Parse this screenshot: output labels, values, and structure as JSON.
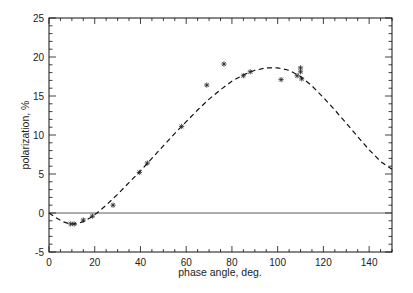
{
  "chart_data": {
    "type": "scatter",
    "title": "",
    "xlabel": "phase angle, deg.",
    "ylabel": "polarization, %",
    "xlim": [
      0,
      150
    ],
    "ylim": [
      -5,
      25
    ],
    "x_ticks": [
      0,
      20,
      40,
      60,
      80,
      100,
      120,
      140
    ],
    "y_ticks": [
      -5,
      0,
      5,
      10,
      15,
      20,
      25
    ],
    "x_minor_step": 5,
    "y_minor_step": 1,
    "grid": false,
    "legend": null,
    "zero_line": true,
    "series": [
      {
        "name": "observations",
        "style": "asterisk-markers",
        "points": [
          [
            9.5,
            -1.4
          ],
          [
            11,
            -1.4
          ],
          [
            15,
            -0.9
          ],
          [
            19,
            -0.4
          ],
          [
            28,
            1.0
          ],
          [
            39.5,
            5.2
          ],
          [
            43,
            6.4
          ],
          [
            58,
            11.1
          ],
          [
            69,
            16.4
          ],
          [
            76.5,
            19.1
          ],
          [
            85,
            17.6
          ],
          [
            88,
            18.1
          ],
          [
            101.5,
            17.1
          ],
          [
            108.5,
            17.6
          ],
          [
            110,
            18.6
          ],
          [
            110,
            18.1
          ],
          [
            110.5,
            17.2
          ]
        ]
      },
      {
        "name": "fit",
        "style": "dashed-line",
        "points": [
          [
            0,
            0
          ],
          [
            3,
            -0.6
          ],
          [
            6,
            -1.1
          ],
          [
            9,
            -1.4
          ],
          [
            12,
            -1.4
          ],
          [
            15,
            -1.1
          ],
          [
            18,
            -0.6
          ],
          [
            21,
            0.0
          ],
          [
            25,
            1.0
          ],
          [
            30,
            2.4
          ],
          [
            35,
            3.9
          ],
          [
            40,
            5.4
          ],
          [
            45,
            7.0
          ],
          [
            50,
            8.6
          ],
          [
            55,
            10.2
          ],
          [
            60,
            11.7
          ],
          [
            65,
            13.2
          ],
          [
            70,
            14.6
          ],
          [
            75,
            15.8
          ],
          [
            80,
            16.9
          ],
          [
            85,
            17.7
          ],
          [
            90,
            18.3
          ],
          [
            95,
            18.6
          ],
          [
            100,
            18.6
          ],
          [
            105,
            18.3
          ],
          [
            110,
            17.5
          ],
          [
            115,
            16.3
          ],
          [
            120,
            14.8
          ],
          [
            125,
            13.2
          ],
          [
            130,
            11.5
          ],
          [
            135,
            9.8
          ],
          [
            140,
            8.1
          ],
          [
            145,
            6.6
          ],
          [
            150,
            5.6
          ]
        ]
      }
    ]
  }
}
